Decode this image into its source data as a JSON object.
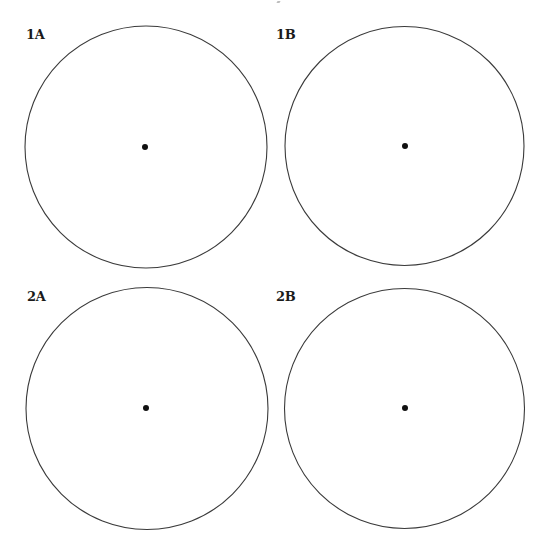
{
  "figure": {
    "panels": [
      {
        "label": "1A",
        "circle": {
          "cx": 146,
          "cy": 147,
          "r": 121
        },
        "center_dot": {
          "cx": 145,
          "cy": 147,
          "r": 3
        },
        "label_pos": {
          "x": 26,
          "y": 28
        }
      },
      {
        "label": "1B",
        "circle": {
          "cx": 404.5,
          "cy": 146,
          "r": 119.5
        },
        "center_dot": {
          "cx": 405,
          "cy": 146,
          "r": 3
        },
        "label_pos": {
          "x": 276,
          "y": 28
        }
      },
      {
        "label": "2A",
        "circle": {
          "cx": 147,
          "cy": 408.5,
          "r": 121
        },
        "center_dot": {
          "cx": 146,
          "cy": 408,
          "r": 3
        },
        "label_pos": {
          "x": 27,
          "y": 290
        }
      },
      {
        "label": "2B",
        "circle": {
          "cx": 404.5,
          "cy": 408.5,
          "r": 120
        },
        "center_dot": {
          "cx": 405,
          "cy": 408,
          "r": 3
        },
        "label_pos": {
          "x": 276,
          "y": 290
        }
      }
    ],
    "colors": {
      "circle_stroke": "#3a3a3a",
      "dot_fill": "#111111",
      "label": "#1a1a1a",
      "background": "#ffffff"
    }
  }
}
